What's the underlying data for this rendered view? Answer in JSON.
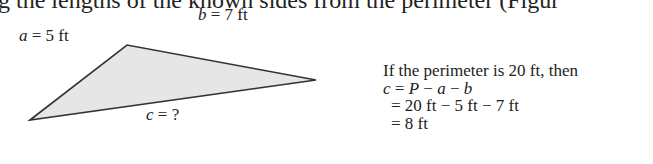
{
  "context_text": "g the lengths of the known sides from the perimeter (Figur",
  "figure": {
    "triangle": {
      "vertices": [
        [
          30,
          120
        ],
        [
          127,
          45
        ],
        [
          316,
          80
        ]
      ],
      "fill": "#e6e6e6",
      "stroke": "#333333"
    },
    "labels": {
      "a_var": "a",
      "a_val": " = 5 ft",
      "b_var": "b",
      "b_val": " = 7 ft",
      "c_var": "c",
      "c_val": " = ?"
    }
  },
  "solution": {
    "intro": "If the perimeter is 20 ft, then",
    "line1_c": "c",
    "line1_eq": " = ",
    "line1_P": "P",
    "line1_m1": " − ",
    "line1_a": "a",
    "line1_m2": " − ",
    "line1_b": "b",
    "line2": "= 20 ft − 5 ft − 7 ft",
    "line3": "= 8 ft"
  }
}
